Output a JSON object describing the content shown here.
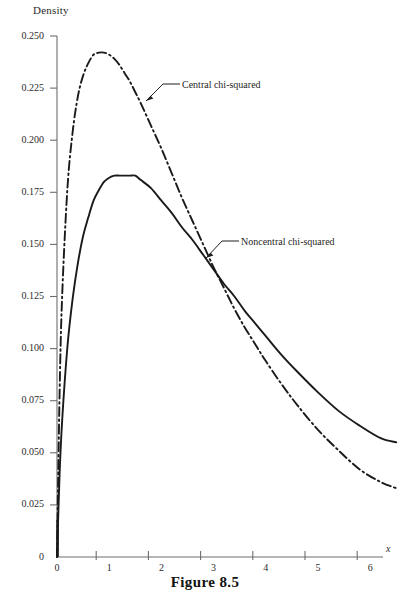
{
  "figure": {
    "caption": "Figure 8.5",
    "ylabel": "Density",
    "xlabel": "x"
  },
  "annotations": {
    "central": "Central chi-squared",
    "noncentral": "Noncentral chi-squared"
  },
  "colors": {
    "axis": "#6e6e6e",
    "curve": "#1a1a1a",
    "background": "#ffffff",
    "text": "#1f1f1f"
  },
  "axis": {
    "y_ticks": [
      "0",
      "0.025",
      "0.050",
      "0.075",
      "0.100",
      "0.125",
      "0.150",
      "0.175",
      "0.200",
      "0.225",
      "0.250"
    ],
    "y_tick_values": [
      0,
      0.025,
      0.05,
      0.075,
      0.1,
      0.125,
      0.15,
      0.175,
      0.2,
      0.225,
      0.25
    ],
    "x_ticks": [
      "0",
      "1",
      "2",
      "3",
      "4",
      "5",
      "6"
    ],
    "x_tick_values": [
      0,
      1,
      2,
      3,
      4,
      5,
      6
    ]
  },
  "chart_data": {
    "type": "line",
    "title": "Figure 8.5",
    "xlabel": "x",
    "ylabel": "Density",
    "xlim": [
      0,
      6.6
    ],
    "ylim": [
      0,
      0.25
    ],
    "grid": false,
    "legend": "annotations-with-leader-lines",
    "series": [
      {
        "name": "Central chi-squared",
        "style": "dash-dot",
        "peak": {
          "x": 1.05,
          "y": 0.242
        },
        "x": [
          0.0,
          0.05,
          0.1,
          0.2,
          0.3,
          0.4,
          0.5,
          0.6,
          0.7,
          0.8,
          0.9,
          1.0,
          1.1,
          1.2,
          1.3,
          1.4,
          1.5,
          1.6,
          1.8,
          2.0,
          2.2,
          2.4,
          2.6,
          2.8,
          3.0,
          3.2,
          3.4,
          3.6,
          3.8,
          4.0,
          4.3,
          4.6,
          5.0,
          5.4,
          5.8,
          6.2,
          6.5
        ],
        "y": [
          0.0,
          0.079,
          0.126,
          0.177,
          0.204,
          0.221,
          0.231,
          0.237,
          0.241,
          0.242,
          0.242,
          0.241,
          0.239,
          0.236,
          0.232,
          0.228,
          0.223,
          0.218,
          0.207,
          0.196,
          0.184,
          0.172,
          0.161,
          0.15,
          0.139,
          0.129,
          0.119,
          0.11,
          0.102,
          0.094,
          0.083,
          0.073,
          0.061,
          0.051,
          0.042,
          0.036,
          0.033
        ]
      },
      {
        "name": "Noncentral chi-squared",
        "style": "solid",
        "peak": {
          "x": 1.5,
          "y": 0.183
        },
        "x": [
          0.0,
          0.05,
          0.1,
          0.2,
          0.3,
          0.4,
          0.5,
          0.6,
          0.7,
          0.8,
          0.9,
          1.0,
          1.1,
          1.2,
          1.3,
          1.4,
          1.5,
          1.6,
          1.8,
          2.0,
          2.2,
          2.4,
          2.6,
          2.8,
          3.0,
          3.2,
          3.4,
          3.6,
          3.8,
          4.0,
          4.3,
          4.6,
          5.0,
          5.4,
          5.8,
          6.2,
          6.5
        ],
        "y": [
          0.0,
          0.04,
          0.066,
          0.101,
          0.124,
          0.141,
          0.154,
          0.163,
          0.171,
          0.176,
          0.18,
          0.182,
          0.183,
          0.183,
          0.183,
          0.183,
          0.183,
          0.181,
          0.177,
          0.171,
          0.165,
          0.158,
          0.152,
          0.145,
          0.138,
          0.131,
          0.125,
          0.118,
          0.112,
          0.106,
          0.097,
          0.089,
          0.079,
          0.07,
          0.063,
          0.057,
          0.055
        ]
      }
    ],
    "crossing_point": {
      "x": 2.9,
      "y": 0.148
    }
  }
}
